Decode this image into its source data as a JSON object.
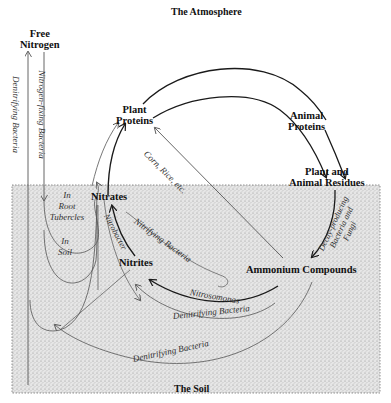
{
  "diagram": {
    "title": "The Atmosphere",
    "soil_label": "The Soil",
    "nodes": {
      "free_nitrogen": "Free\nNitrogen",
      "free_nitrogen_l1": "Free",
      "free_nitrogen_l2": "Nitrogen",
      "plant_proteins_l1": "Plant",
      "plant_proteins_l2": "Proteins",
      "animal_proteins_l1": "Animal",
      "animal_proteins_l2": "Proteins",
      "residues_l1": "Plant and",
      "residues_l2": "Animal Residues",
      "nitrates": "Nitrates",
      "nitrites": "Nitrites",
      "ammonium": "Ammonium Compounds"
    },
    "edge_labels": {
      "nitrogen_fixing": "Nitrogen-fixing Bacteria",
      "denitrifying_vertical": "Denitrifying Bacteria",
      "in_root_l1": "In",
      "in_root_l2": "Root",
      "in_root_l3": "Tubercles",
      "in_soil_l1": "In",
      "in_soil_l2": "Soil",
      "corn_rice": "Corn, Rice, etc.",
      "nitrobacter": "Nitrobacter",
      "nitrifying": "Nitrifying Bacteria",
      "nitrosomonas": "Nitrosomonas",
      "denitrifying_inner": "Denitrifying Bacteria",
      "denitrifying_outer": "Denitrifying Bacteria",
      "decay_l1": "Decay-producing",
      "decay_l2": "Bacteria and",
      "decay_l3": "Fungi"
    },
    "colors": {
      "soil_fill": "#d9d9d9",
      "line": "#1a1a1a",
      "thin_line": "#555555"
    }
  }
}
